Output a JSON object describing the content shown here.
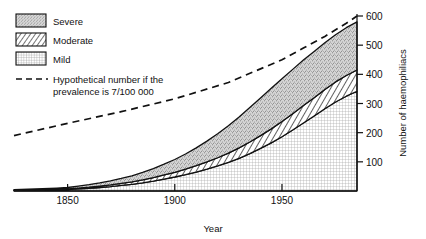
{
  "chart_data": {
    "type": "area",
    "title": "",
    "xlabel": "Year",
    "ylabel": "Number of haemophiliacs",
    "xlim": [
      1825,
      1985
    ],
    "ylim": [
      0,
      600
    ],
    "xticks": [
      1850,
      1900,
      1950
    ],
    "yticks": [
      100,
      200,
      300,
      400,
      500,
      600
    ],
    "grid": false,
    "legend_position": "top-left",
    "stacked": true,
    "x": [
      1825,
      1835,
      1845,
      1850,
      1855,
      1860,
      1865,
      1870,
      1875,
      1880,
      1885,
      1890,
      1895,
      1900,
      1905,
      1910,
      1915,
      1920,
      1925,
      1930,
      1935,
      1940,
      1945,
      1950,
      1955,
      1960,
      1965,
      1970,
      1975,
      1980,
      1985
    ],
    "series": [
      {
        "name": "Mild",
        "fill": "mild",
        "values": [
          2,
          3,
          4,
          5,
          7,
          9,
          12,
          15,
          19,
          23,
          28,
          34,
          41,
          48,
          56,
          65,
          75,
          86,
          98,
          112,
          128,
          146,
          165,
          186,
          209,
          233,
          257,
          282,
          305,
          325,
          342
        ]
      },
      {
        "name": "Moderate",
        "fill": "moderate",
        "values": [
          1,
          1,
          2,
          2,
          3,
          4,
          5,
          6,
          7,
          8,
          10,
          12,
          14,
          16,
          19,
          22,
          25,
          28,
          32,
          36,
          40,
          44,
          48,
          52,
          56,
          60,
          63,
          66,
          69,
          71,
          73
        ]
      },
      {
        "name": "Severe",
        "fill": "severe",
        "values": [
          2,
          3,
          4,
          5,
          7,
          9,
          11,
          14,
          17,
          21,
          26,
          31,
          37,
          44,
          52,
          61,
          71,
          82,
          94,
          106,
          118,
          129,
          139,
          147,
          152,
          156,
          158,
          160,
          162,
          164,
          165
        ]
      }
    ],
    "totals": [
      5,
      7,
      10,
      12,
      17,
      22,
      28,
      35,
      43,
      52,
      64,
      77,
      92,
      108,
      127,
      148,
      171,
      196,
      224,
      254,
      286,
      319,
      352,
      385,
      417,
      449,
      478,
      508,
      536,
      560,
      580
    ],
    "reference_line": {
      "name": "Hypothetical number if the prevalence is 7/100 000",
      "style": "dashed",
      "x": [
        1825,
        1850,
        1875,
        1900,
        1925,
        1950,
        1960,
        1970,
        1980,
        1985
      ],
      "values": [
        190,
        232,
        272,
        316,
        372,
        450,
        490,
        530,
        575,
        600
      ]
    }
  },
  "legend": {
    "items": [
      {
        "label": "Severe",
        "swatch": "severe"
      },
      {
        "label": "Moderate",
        "swatch": "moderate"
      },
      {
        "label": "Mild",
        "swatch": "mild"
      }
    ],
    "line_entry": {
      "label_line1": "Hypothetical number if the",
      "label_line2": "prevalence is 7/100 000"
    }
  },
  "axes": {
    "x_title": "Year",
    "y_title": "Number of haemophiliacs",
    "x_ticks": [
      "1850",
      "1900",
      "1950"
    ],
    "y_ticks": [
      "100",
      "200",
      "300",
      "400",
      "500",
      "600"
    ]
  },
  "colors": {
    "ink": "#111111",
    "severe_fill": "#c8c8c8",
    "moderate_fill": "#ffffff",
    "mild_fill": "#ffffff"
  }
}
